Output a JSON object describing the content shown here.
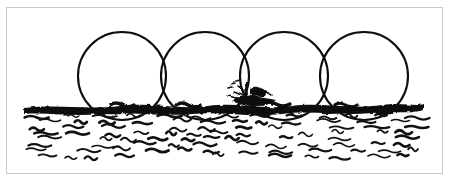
{
  "figure": {
    "medium": "black ink line drawing",
    "background_color": "#ffffff",
    "ink_color": "#111111",
    "frame": {
      "visible": true,
      "color": "#c9c9c9",
      "x": 6,
      "y": 7,
      "width": 437,
      "height": 167
    },
    "alt_text": "Pen and ink sketch: four large overlapping outlined circles sit in a row on a heavy black horizon band, with scribbled wave marks filling the water below and a small dark boat silhouette at the center of the horizon."
  },
  "chart_data": {
    "type": "scatter",
    "xlabel": "",
    "ylabel": "",
    "xlim": [
      0,
      450
    ],
    "ylim": [
      182,
      0
    ],
    "grid": false,
    "legend": "none",
    "circles": [
      {
        "name": "circle-1",
        "cx": 122,
        "cy": 76,
        "r": 44,
        "stroke": "#111111",
        "stroke_width": 2.1,
        "fill": "none"
      },
      {
        "name": "circle-2",
        "cx": 205,
        "cy": 76,
        "r": 44,
        "stroke": "#111111",
        "stroke_width": 2.1,
        "fill": "none"
      },
      {
        "name": "circle-3",
        "cx": 284,
        "cy": 76,
        "r": 44,
        "stroke": "#111111",
        "stroke_width": 2.1,
        "fill": "none"
      },
      {
        "name": "circle-4",
        "cx": 364,
        "cy": 76,
        "r": 44,
        "stroke": "#111111",
        "stroke_width": 2.1,
        "fill": "none"
      }
    ],
    "horizon": {
      "name": "shoreline-band",
      "y_top": 103,
      "y_bottom": 113,
      "x_start": 24,
      "x_end": 424,
      "color": "#111111"
    },
    "boat": {
      "name": "boat-silhouette",
      "cx": 250,
      "cy": 96,
      "width": 42,
      "height": 22,
      "color": "#111111"
    },
    "water": {
      "region": {
        "x": 24,
        "y": 112,
        "width": 400,
        "height": 52
      },
      "stroke_color": "#111111",
      "stroke_count": 118
    }
  }
}
